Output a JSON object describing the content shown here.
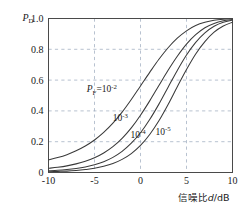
{
  "chart_data": {
    "type": "line",
    "title": "",
    "subtitle": "",
    "xlabel": "信噪比d/dB",
    "xlabel_parts": {
      "cjk": "信噪比",
      "italic_var": "d",
      "unit": "/dB"
    },
    "ylabel": "PD",
    "ylabel_parts": {
      "symbol": "P",
      "subscript": "D"
    },
    "xlim": [
      -10,
      10
    ],
    "ylim": [
      0,
      1.0
    ],
    "grid": true,
    "grid_style": "dashed",
    "legend": "inline-curve-labels",
    "x_ticks": [
      "-10",
      "-5",
      "0",
      "5",
      "10"
    ],
    "x_tick_values": [
      -10,
      -5,
      0,
      5,
      10
    ],
    "y_ticks": [
      "0",
      "0.2",
      "0.4",
      "0.6",
      "0.8",
      "1.0"
    ],
    "y_tick_values": [
      0,
      0.2,
      0.4,
      0.6,
      0.8,
      1.0
    ],
    "series": [
      {
        "name": "PF=10^-2",
        "label_text": "PF=10",
        "label_symbol": "P",
        "label_subscript": "F",
        "label_equals": "=10",
        "label_exponent": "-2",
        "label_x": -4.2,
        "label_y": 0.52,
        "x": [
          -10,
          -9,
          -8,
          -7,
          -6,
          -5,
          -4,
          -3,
          -2,
          -1,
          0,
          1,
          2,
          3,
          4,
          5,
          6,
          7,
          8,
          9,
          10
        ],
        "values": [
          0.082,
          0.097,
          0.116,
          0.141,
          0.172,
          0.211,
          0.26,
          0.32,
          0.392,
          0.474,
          0.562,
          0.65,
          0.735,
          0.81,
          0.872,
          0.92,
          0.954,
          0.975,
          0.988,
          0.995,
          0.999
        ]
      },
      {
        "name": "PF=10^-3",
        "label_text": "10",
        "label_exponent": "-3",
        "label_x": -2.2,
        "label_y": 0.335,
        "x": [
          -10,
          -9,
          -8,
          -7,
          -6,
          -5,
          -4,
          -3,
          -2,
          -1,
          0,
          1,
          2,
          3,
          4,
          5,
          6,
          7,
          8,
          9,
          10
        ],
        "values": [
          0.027,
          0.034,
          0.043,
          0.056,
          0.073,
          0.096,
          0.127,
          0.168,
          0.222,
          0.29,
          0.372,
          0.465,
          0.565,
          0.664,
          0.755,
          0.834,
          0.895,
          0.94,
          0.968,
          0.985,
          0.994
        ]
      },
      {
        "name": "PF=10^-4",
        "label_text": "10",
        "label_exponent": "-4",
        "label_x": -0.25,
        "label_y": 0.225,
        "x": [
          -10,
          -9,
          -8,
          -7,
          -6,
          -5,
          -4,
          -3,
          -2,
          -1,
          0,
          1,
          2,
          3,
          4,
          5,
          6,
          7,
          8,
          9,
          10
        ],
        "values": [
          0.011,
          0.014,
          0.019,
          0.026,
          0.036,
          0.05,
          0.07,
          0.098,
          0.137,
          0.19,
          0.258,
          0.344,
          0.444,
          0.554,
          0.663,
          0.763,
          0.845,
          0.907,
          0.95,
          0.976,
          0.99
        ]
      },
      {
        "name": "PF=10^-5",
        "label_text": "10",
        "label_exponent": "-5",
        "label_x": 2.45,
        "label_y": 0.245,
        "x": [
          -10,
          -9,
          -8,
          -7,
          -6,
          -5,
          -4,
          -3,
          -2,
          -1,
          0,
          1,
          2,
          3,
          4,
          5,
          6,
          7,
          8,
          9,
          10
        ],
        "values": [
          0.005,
          0.007,
          0.009,
          0.013,
          0.019,
          0.027,
          0.04,
          0.058,
          0.085,
          0.123,
          0.176,
          0.247,
          0.336,
          0.442,
          0.557,
          0.669,
          0.77,
          0.85,
          0.911,
          0.951,
          0.976
        ]
      }
    ],
    "colors": {
      "curve": "#3a3a3a",
      "grid": "#9aa7bb",
      "axis": "#4a4a4a",
      "text": "#1a1a1a",
      "background": "#ffffff"
    }
  }
}
